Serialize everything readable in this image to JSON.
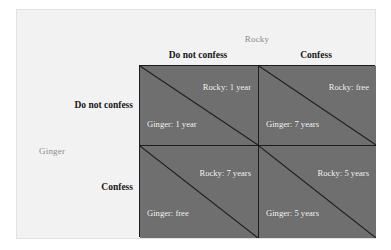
{
  "figure": {
    "type": "payoff-matrix",
    "column_player": "Rocky",
    "row_player": "Ginger"
  },
  "axis": {
    "column_label": "Rocky",
    "row_label": "Ginger"
  },
  "columns": [
    {
      "label": "Do not confess"
    },
    {
      "label": "Confess"
    }
  ],
  "rows": [
    {
      "label": "Do not confess"
    },
    {
      "label": "Confess"
    }
  ],
  "cells": [
    {
      "row": "Do not confess",
      "column": "Do not confess",
      "top_payoff": "Rocky: 1 year",
      "bottom_payoff": "Ginger: 1 year"
    },
    {
      "row": "Do not confess",
      "column": "Confess",
      "top_payoff": "Rocky: free",
      "bottom_payoff": "Ginger: 7 years"
    },
    {
      "row": "Confess",
      "column": "Do not confess",
      "top_payoff": "Rocky: 7 years",
      "bottom_payoff": "Ginger: free"
    },
    {
      "row": "Confess",
      "column": "Confess",
      "top_payoff": "Rocky: 5 years",
      "bottom_payoff": "Ginger: 5 years"
    }
  ],
  "colors": {
    "cell_fill": "#6f6f6f",
    "cell_border": "#1c1c1c",
    "payoff_text": "#ffffff",
    "header_text": "#161616",
    "axis_label_text": "#8c8c8c",
    "page_background": "#f2f2f2"
  }
}
